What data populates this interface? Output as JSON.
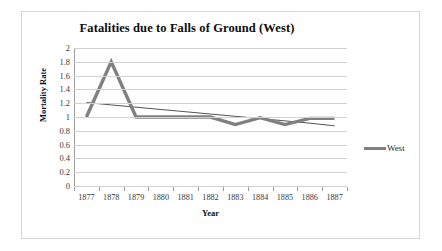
{
  "chart_data": {
    "type": "line",
    "title": "Fatalities due to Falls of Ground (West)",
    "xlabel": "Year",
    "ylabel": "Mortality Rate",
    "categories": [
      "1877",
      "1878",
      "1879",
      "1880",
      "1881",
      "1882",
      "1883",
      "1884",
      "1885",
      "1886",
      "1887"
    ],
    "series": [
      {
        "name": "West",
        "color": "#808080",
        "values": [
          1.0,
          1.8,
          1.0,
          1.0,
          1.0,
          1.0,
          0.89,
          0.99,
          0.89,
          0.98,
          0.98
        ]
      },
      {
        "name": "trendline",
        "color": "#404040",
        "values": [
          1.21,
          1.175,
          1.142,
          1.109,
          1.076,
          1.043,
          1.01,
          0.977,
          0.944,
          0.911,
          0.872
        ]
      }
    ],
    "ylim": [
      0,
      2
    ],
    "yticks": [
      "2",
      "1.8",
      "1.6",
      "1.4",
      "1.2",
      "1",
      "0.8",
      "0.6",
      "0.4",
      "0.2",
      "0"
    ],
    "ytick_values": [
      2,
      1.8,
      1.6,
      1.4,
      1.2,
      1,
      0.8,
      0.6,
      0.4,
      0.2,
      0
    ],
    "grid": true,
    "grid_color": "#d2d2d2",
    "legend_position": "right",
    "legend": [
      {
        "label": "West",
        "color": "#808080"
      }
    ]
  }
}
